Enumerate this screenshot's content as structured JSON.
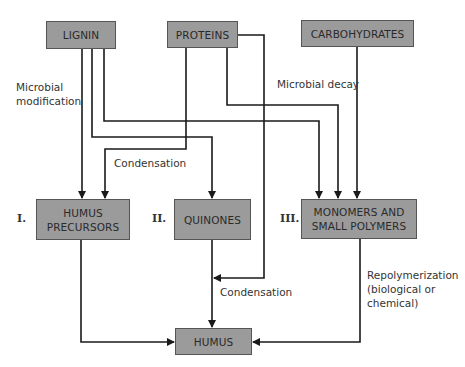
{
  "diagram": {
    "nodes": {
      "lignin": "LIGNIN",
      "proteins": "PROTEINS",
      "carbohydrates": "CARBOHYDRATES",
      "humus_precursors_line1": "HUMUS",
      "humus_precursors_line2": "PRECURSORS",
      "quinones": "QUINONES",
      "monomers_line1": "MONOMERS AND",
      "monomers_line2": "SMALL POLYMERS",
      "humus": "HUMUS"
    },
    "pathway_numbers": {
      "one": "I.",
      "two": "II.",
      "three": "III."
    },
    "edge_labels": {
      "microbial_modification_line1": "Microbial",
      "microbial_modification_line2": "modification",
      "microbial_decay": "Microbial decay",
      "condensation_upper": "Condensation",
      "condensation_lower": "Condensation",
      "repolymerization_line1": "Repolymerization",
      "repolymerization_line2": "(biological or",
      "repolymerization_line3": "chemical)"
    },
    "colors": {
      "box_fill": "#9b9b9b",
      "line": "#1a1a1a"
    }
  }
}
